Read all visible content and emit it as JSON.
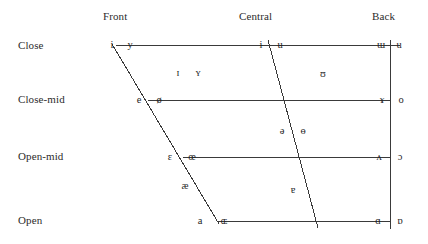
{
  "chart_data": {
    "type": "scatter",
    "xlabel": "",
    "ylabel": "",
    "grid": true,
    "legend": "none",
    "axis_columns": [
      "Front",
      "Central",
      "Back"
    ],
    "axis_rows": [
      "Close",
      "Close-mid",
      "Open-mid",
      "Open"
    ],
    "points": [
      {
        "symbol": "i",
        "backness": "front",
        "height": "close",
        "rounded": false,
        "x": 112,
        "y": 45
      },
      {
        "symbol": "y",
        "backness": "front",
        "height": "close",
        "rounded": true,
        "x": 130,
        "y": 45
      },
      {
        "symbol": "ɨ",
        "backness": "central",
        "height": "close",
        "rounded": false,
        "x": 261,
        "y": 45
      },
      {
        "symbol": "ʉ",
        "backness": "central",
        "height": "close",
        "rounded": true,
        "x": 280,
        "y": 45
      },
      {
        "symbol": "ɯ",
        "backness": "back",
        "height": "close",
        "rounded": false,
        "x": 381,
        "y": 45
      },
      {
        "symbol": "u",
        "backness": "back",
        "height": "close",
        "rounded": true,
        "x": 399,
        "y": 45
      },
      {
        "symbol": "ɪ",
        "backness": "near-front",
        "height": "near-close",
        "rounded": false,
        "x": 178,
        "y": 73
      },
      {
        "symbol": "ʏ",
        "backness": "near-front",
        "height": "near-close",
        "rounded": true,
        "x": 198,
        "y": 73
      },
      {
        "symbol": "ʊ",
        "backness": "near-back",
        "height": "near-close",
        "rounded": true,
        "x": 323,
        "y": 74
      },
      {
        "symbol": "e",
        "backness": "front",
        "height": "close-mid",
        "rounded": false,
        "x": 139,
        "y": 100
      },
      {
        "symbol": "ø",
        "backness": "front",
        "height": "close-mid",
        "rounded": true,
        "x": 159,
        "y": 100
      },
      {
        "symbol": "ɤ",
        "backness": "back",
        "height": "close-mid",
        "rounded": false,
        "x": 382,
        "y": 100
      },
      {
        "symbol": "o",
        "backness": "back",
        "height": "close-mid",
        "rounded": true,
        "x": 401,
        "y": 100
      },
      {
        "symbol": "ə",
        "backness": "central",
        "height": "mid",
        "rounded": false,
        "x": 282,
        "y": 131
      },
      {
        "symbol": "ɵ",
        "backness": "central",
        "height": "mid",
        "rounded": true,
        "x": 303,
        "y": 131
      },
      {
        "symbol": "ɛ",
        "backness": "front",
        "height": "open-mid",
        "rounded": false,
        "x": 170,
        "y": 157
      },
      {
        "symbol": "œ",
        "backness": "front",
        "height": "open-mid",
        "rounded": true,
        "x": 192,
        "y": 157
      },
      {
        "symbol": "ʌ",
        "backness": "back",
        "height": "open-mid",
        "rounded": false,
        "x": 379,
        "y": 157
      },
      {
        "symbol": "ɔ",
        "backness": "back",
        "height": "open-mid",
        "rounded": true,
        "x": 400,
        "y": 157
      },
      {
        "symbol": "æ",
        "backness": "near-front",
        "height": "near-open",
        "rounded": false,
        "x": 185,
        "y": 186
      },
      {
        "symbol": "ɐ",
        "backness": "central",
        "height": "near-open",
        "rounded": false,
        "x": 293,
        "y": 190
      },
      {
        "symbol": "a",
        "backness": "front",
        "height": "open",
        "rounded": false,
        "x": 200,
        "y": 221
      },
      {
        "symbol": "ɶ",
        "backness": "front",
        "height": "open",
        "rounded": true,
        "x": 224,
        "y": 221
      },
      {
        "symbol": "ɑ",
        "backness": "back",
        "height": "open",
        "rounded": false,
        "x": 378,
        "y": 221
      },
      {
        "symbol": "ɒ",
        "backness": "back",
        "height": "open",
        "rounded": true,
        "x": 400,
        "y": 221
      }
    ],
    "grid_lines": [
      {
        "name": "close-line",
        "x1": 112,
        "y1": 45,
        "x2": 400,
        "y2": 46
      },
      {
        "name": "close-mid-line",
        "x1": 148,
        "y1": 100,
        "x2": 390,
        "y2": 100
      },
      {
        "name": "open-mid-line",
        "x1": 183,
        "y1": 157,
        "x2": 390,
        "y2": 157
      },
      {
        "name": "open-line",
        "x1": 218,
        "y1": 221,
        "x2": 390,
        "y2": 221
      },
      {
        "name": "front-edge",
        "x1": 112,
        "y1": 44,
        "x2": 219,
        "y2": 224
      },
      {
        "name": "central-edge",
        "x1": 268,
        "y1": 40,
        "x2": 318,
        "y2": 228
      },
      {
        "name": "back-edge",
        "x1": 390,
        "y1": 40,
        "x2": 390,
        "y2": 229
      }
    ]
  },
  "headers": {
    "columns": [
      {
        "label": "Front",
        "x": 103,
        "y": 11
      },
      {
        "label": "Central",
        "x": 239,
        "y": 11
      },
      {
        "label": "Back",
        "x": 372,
        "y": 11
      }
    ],
    "rows": [
      {
        "label": "Close",
        "x": 18,
        "y": 40
      },
      {
        "label": "Close-mid",
        "x": 18,
        "y": 94
      },
      {
        "label": "Open-mid",
        "x": 18,
        "y": 151
      },
      {
        "label": "Open",
        "x": 18,
        "y": 215
      }
    ]
  },
  "colors": {
    "background": "#ffffff",
    "line": "#3a3a3a",
    "text": "#1f1f1f",
    "label": "#2b2b2b"
  }
}
